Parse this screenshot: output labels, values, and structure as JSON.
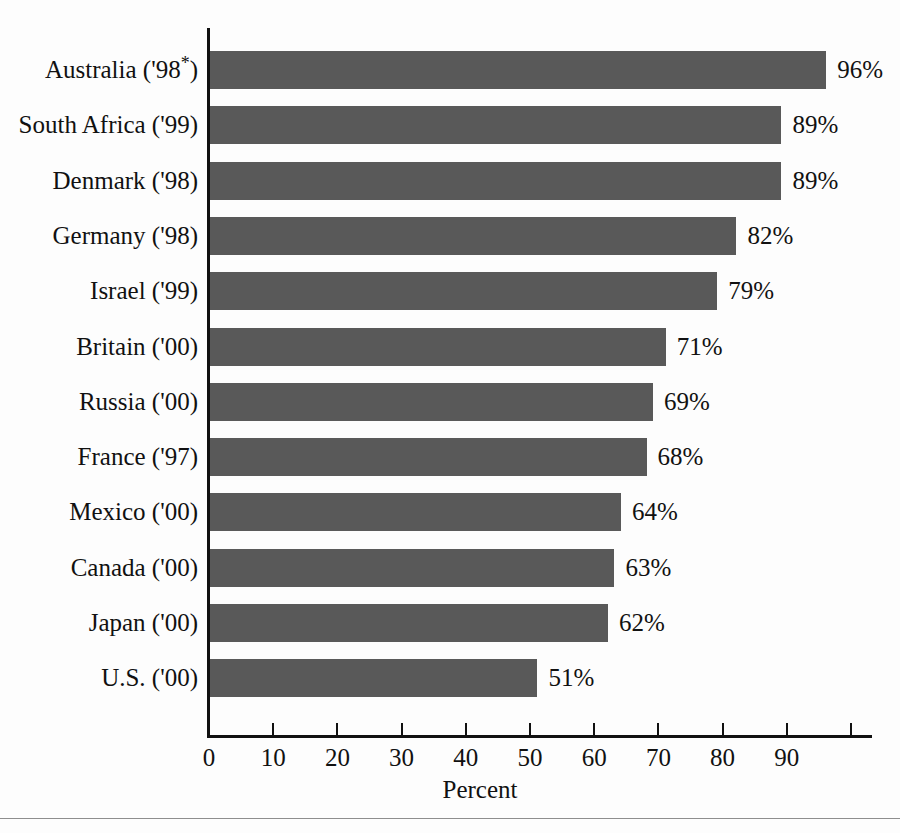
{
  "chart_data": {
    "type": "bar",
    "orientation": "horizontal",
    "title": "",
    "subtitle": "",
    "xlabel": "Percent",
    "ylabel": "",
    "xlim": [
      0,
      100
    ],
    "grid": false,
    "legend": null,
    "bar_color": "#595959",
    "axis_color": "#111111",
    "background_color": "#fdfdfd",
    "categories": [
      "Australia ('98*)",
      "South Africa ('99)",
      "Denmark ('98)",
      "Germany ('98)",
      "Israel ('99)",
      "Britain ('00)",
      "Russia ('00)",
      "France ('97)",
      "Mexico ('00)",
      "Canada ('00)",
      "Japan ('00)",
      "U.S. ('00)"
    ],
    "values": [
      96,
      89,
      89,
      82,
      79,
      71,
      69,
      68,
      64,
      63,
      62,
      51
    ],
    "value_labels": [
      "96%",
      "89%",
      "89%",
      "82%",
      "79%",
      "71%",
      "69%",
      "68%",
      "64%",
      "63%",
      "62%",
      "51%"
    ],
    "xticks": [
      0,
      10,
      20,
      30,
      40,
      50,
      60,
      70,
      80,
      90,
      100
    ],
    "xtick_labels": [
      "0",
      "10",
      "20",
      "30",
      "40",
      "50",
      "60",
      "70",
      "80",
      "90",
      ""
    ],
    "bars": [
      {
        "label_main": "Australia ('98",
        "label_sup": "*",
        "label_tail": ")",
        "value": 96,
        "value_label": "96%"
      },
      {
        "label_main": "South Africa ('99)",
        "label_sup": "",
        "label_tail": "",
        "value": 89,
        "value_label": "89%"
      },
      {
        "label_main": "Denmark ('98)",
        "label_sup": "",
        "label_tail": "",
        "value": 89,
        "value_label": "89%"
      },
      {
        "label_main": "Germany ('98)",
        "label_sup": "",
        "label_tail": "",
        "value": 82,
        "value_label": "82%"
      },
      {
        "label_main": "Israel ('99)",
        "label_sup": "",
        "label_tail": "",
        "value": 79,
        "value_label": "79%"
      },
      {
        "label_main": "Britain ('00)",
        "label_sup": "",
        "label_tail": "",
        "value": 71,
        "value_label": "71%"
      },
      {
        "label_main": "Russia ('00)",
        "label_sup": "",
        "label_tail": "",
        "value": 69,
        "value_label": "69%"
      },
      {
        "label_main": "France ('97)",
        "label_sup": "",
        "label_tail": "",
        "value": 68,
        "value_label": "68%"
      },
      {
        "label_main": "Mexico ('00)",
        "label_sup": "",
        "label_tail": "",
        "value": 64,
        "value_label": "64%"
      },
      {
        "label_main": "Canada ('00)",
        "label_sup": "",
        "label_tail": "",
        "value": 63,
        "value_label": "63%"
      },
      {
        "label_main": "Japan ('00)",
        "label_sup": "",
        "label_tail": "",
        "value": 62,
        "value_label": "62%"
      },
      {
        "label_main": "U.S. ('00)",
        "label_sup": "",
        "label_tail": "",
        "value": 51,
        "value_label": "51%"
      }
    ]
  },
  "layout": {
    "origin_x": 209,
    "px_per_unit": 6.42,
    "first_bar_top": 51,
    "row_pitch": 55.3,
    "bar_height": 38
  }
}
